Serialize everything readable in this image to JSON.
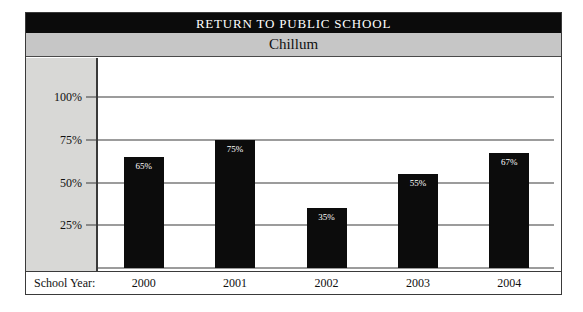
{
  "header": {
    "title": "RETURN TO PUBLIC SCHOOL",
    "subtitle": "Chillum"
  },
  "axis": {
    "category_axis_label": "School Year:"
  },
  "colors": {
    "title_bar_background": "#0b0b0b",
    "title_bar_text": "#ffffff",
    "subtitle_bar_background": "#c6c6c6",
    "axis_panel_background": "#d8d8d6",
    "bar_fill": "#0c0c0c",
    "bar_label_text": "#ffffff",
    "gridline": "#3a3a3a",
    "frame_border": "#3a3a3a",
    "plot_background": "#ffffff"
  },
  "chart_data": {
    "type": "bar",
    "title": "RETURN TO PUBLIC SCHOOL",
    "subtitle": "Chillum",
    "xlabel": "School Year:",
    "ylabel": "",
    "categories": [
      "2000",
      "2001",
      "2002",
      "2003",
      "2004"
    ],
    "values": [
      65,
      75,
      35,
      55,
      67
    ],
    "value_labels": [
      "65%",
      "75%",
      "35%",
      "55%",
      "67%"
    ],
    "ylim": [
      0,
      100
    ],
    "yticks": [
      25,
      50,
      75,
      100
    ],
    "ytick_labels": [
      "25%",
      "50%",
      "75%",
      "100%"
    ],
    "grid": true,
    "legend": false,
    "legend_position": "none",
    "units": "percent"
  }
}
